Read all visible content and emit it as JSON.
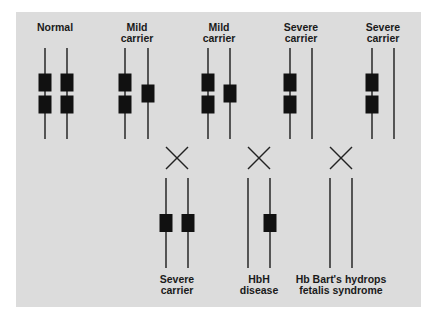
{
  "figure": {
    "parents_row": [
      {
        "label": "Normal",
        "chromosomes": [
          {
            "genes": 2
          },
          {
            "genes": 2
          }
        ]
      },
      {
        "label": "Mild\ncarrier",
        "chromosomes": [
          {
            "genes": 2
          },
          {
            "genes": 1
          }
        ]
      },
      {
        "label": "Mild\ncarrier",
        "chromosomes": [
          {
            "genes": 2
          },
          {
            "genes": 1
          }
        ]
      },
      {
        "label": "Severe\ncarrier",
        "chromosomes": [
          {
            "genes": 2
          },
          {
            "genes": 0
          }
        ]
      },
      {
        "label": "Severe\ncarrier",
        "chromosomes": [
          {
            "genes": 2
          },
          {
            "genes": 0
          }
        ]
      }
    ],
    "crosses": [
      {
        "symbol": "cross",
        "between": [
          1,
          2
        ]
      },
      {
        "symbol": "cross",
        "between": [
          2,
          3
        ]
      },
      {
        "symbol": "cross",
        "between": [
          3,
          4
        ]
      }
    ],
    "offspring_row": [
      {
        "label": "Severe\ncarrier",
        "chromosomes": [
          {
            "genes": 1
          },
          {
            "genes": 1
          }
        ]
      },
      {
        "label": "HbH\ndisease",
        "chromosomes": [
          {
            "genes": 0
          },
          {
            "genes": 1
          }
        ]
      },
      {
        "label": "Hb Bart's hydrops\nfetalis syndrome",
        "chromosomes": [
          {
            "genes": 0
          },
          {
            "genes": 0
          }
        ]
      }
    ],
    "colors": {
      "background": "#dcdcdc",
      "gene": "#111111",
      "line": "#333333"
    }
  }
}
